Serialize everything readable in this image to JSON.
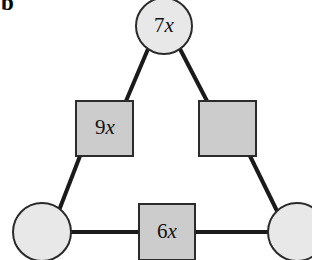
{
  "figure": {
    "panel_letter": "b",
    "type": "graph-diagram",
    "background_color": "#ffffff",
    "edge_color": "#1a1a1a",
    "edge_width": 4,
    "circle_fill": "#e8e8e8",
    "square_fill": "#cccccc",
    "stroke_color": "#2b2b2b",
    "nodes": [
      {
        "id": "top-circle",
        "shape": "circle",
        "label_coefficient": "7",
        "label_variable": "x",
        "label": "7x",
        "cx": 164,
        "cy": 26,
        "r": 28,
        "fill": "#e8e8e8"
      },
      {
        "id": "left-square",
        "shape": "square",
        "label_coefficient": "9",
        "label_variable": "x",
        "label": "9x",
        "x": 76,
        "y": 101,
        "width": 57,
        "height": 55,
        "fill": "#cccccc"
      },
      {
        "id": "right-square",
        "shape": "square",
        "label_coefficient": "",
        "label_variable": "",
        "label": "",
        "x": 199,
        "y": 101,
        "width": 57,
        "height": 55,
        "fill": "#cccccc"
      },
      {
        "id": "bottom-left-circle",
        "shape": "circle",
        "label_coefficient": "",
        "label_variable": "",
        "label": "",
        "cx": 42,
        "cy": 232,
        "r": 29,
        "fill": "#e8e8e8"
      },
      {
        "id": "bottom-square",
        "shape": "square",
        "label_coefficient": "6",
        "label_variable": "x",
        "label": "6x",
        "x": 139,
        "y": 204,
        "width": 56,
        "height": 56,
        "fill": "#cccccc"
      },
      {
        "id": "bottom-right-circle",
        "shape": "circle",
        "label_coefficient": "",
        "label_variable": "",
        "label": "",
        "cx": 297,
        "cy": 232,
        "r": 29,
        "fill": "#e8e8e8"
      }
    ],
    "edges": [
      {
        "id": "edge-top-to-left-square",
        "from": "top-circle",
        "to": "left-square",
        "x1": 148,
        "y1": 49,
        "x2": 126,
        "y2": 101
      },
      {
        "id": "edge-top-to-right-square",
        "from": "top-circle",
        "to": "right-square",
        "x1": 180,
        "y1": 49,
        "x2": 207,
        "y2": 101
      },
      {
        "id": "edge-left-square-to-bottom-left-circle",
        "from": "left-square",
        "to": "bottom-left-circle",
        "x1": 80,
        "y1": 156,
        "x2": 58,
        "y2": 213
      },
      {
        "id": "edge-right-square-to-bottom-right-circle",
        "from": "right-square",
        "to": "bottom-right-circle",
        "x1": 250,
        "y1": 156,
        "x2": 279,
        "y2": 215
      },
      {
        "id": "edge-bottom-left-circle-to-bottom-square",
        "from": "bottom-left-circle",
        "to": "bottom-square",
        "x1": 71,
        "y1": 232,
        "x2": 139,
        "y2": 232
      },
      {
        "id": "edge-bottom-square-to-bottom-right-circle",
        "from": "bottom-square",
        "to": "bottom-right-circle",
        "x1": 195,
        "y1": 232,
        "x2": 268,
        "y2": 232
      }
    ]
  }
}
